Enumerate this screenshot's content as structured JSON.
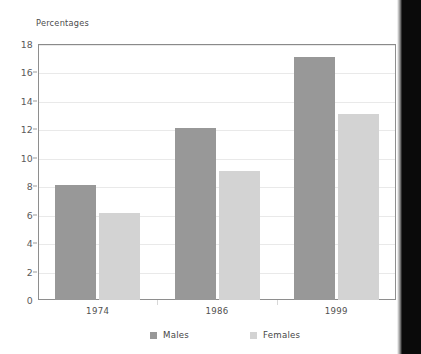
{
  "chart_data": {
    "type": "bar",
    "title": "Percentages",
    "xlabel": "",
    "ylabel": "Percentages",
    "categories": [
      "1974",
      "1986",
      "1999"
    ],
    "series": [
      {
        "name": "Males",
        "color": "#989898",
        "values": [
          8.1,
          12.1,
          17.1
        ]
      },
      {
        "name": "Females",
        "color": "#d3d3d3",
        "values": [
          6.1,
          9.1,
          13.1
        ]
      }
    ],
    "ylim": [
      0,
      18
    ],
    "yticks": [
      0,
      2,
      4,
      6,
      8,
      10,
      12,
      14,
      16,
      18
    ],
    "ytick_labels": [
      "0",
      "2",
      "4",
      "6",
      "8",
      "10",
      "12",
      "14",
      "16",
      "18"
    ],
    "grid": true,
    "grid_axis": "y",
    "legend_position": "bottom",
    "legend_entries": [
      "Males",
      "Females"
    ]
  },
  "legend": {
    "items": [
      {
        "label": "Males"
      },
      {
        "label": "Females"
      }
    ]
  }
}
